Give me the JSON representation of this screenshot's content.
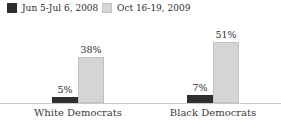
{
  "legend": {
    "items": [
      {
        "label": "Jun 5-Jul 6, 2008",
        "color": "#2e2e2e",
        "border_color": "#2e2e2e"
      },
      {
        "label": "Oct 16-19, 2009",
        "color": "#d5d5d5",
        "border_color": "#c2c2c2"
      }
    ]
  },
  "chart_data": {
    "type": "bar",
    "title": "",
    "categories": [
      "White Democrats",
      "Black Democrats"
    ],
    "series": [
      {
        "name": "Jun 5-Jul 6, 2008",
        "values": [
          5,
          7
        ],
        "labels": [
          "5%",
          "7%"
        ],
        "color": "#2e2e2e",
        "border_color": "#2e2e2e"
      },
      {
        "name": "Oct 16-19, 2009",
        "values": [
          38,
          51
        ],
        "labels": [
          "38%",
          "51%"
        ],
        "color": "#d5d5d5",
        "border_color": "#c2c2c2"
      }
    ],
    "xlabel": "",
    "ylabel": "",
    "ylim": [
      0,
      55
    ],
    "grid": false,
    "legend_position": "top-left",
    "axis_line_color": "#c9c9c9"
  }
}
